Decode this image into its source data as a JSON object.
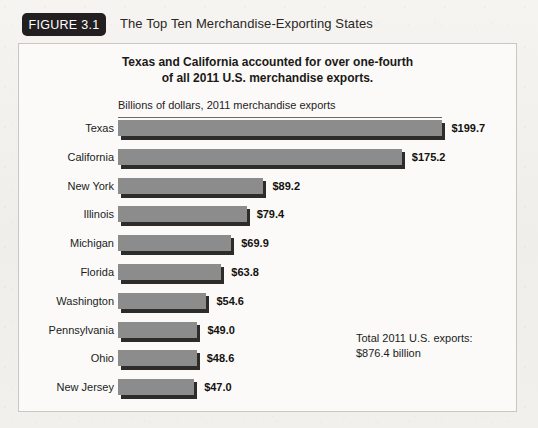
{
  "figure": {
    "badge_label": "FIGURE 3.1",
    "title": "The Top Ten Merchandise-Exporting States"
  },
  "chart_data": {
    "type": "bar",
    "orientation": "horizontal",
    "title": "Texas and California accounted for over one-fourth of all 2011 U.S. merchandise exports.",
    "title_line1": "Texas and California accounted for over one-fourth",
    "title_line2": "of all 2011 U.S. merchandise exports.",
    "subtitle": "Billions of dollars, 2011 merchandise exports",
    "xlabel": "Billions of dollars, 2011 merchandise exports",
    "ylabel": "",
    "xlim": [
      0,
      200
    ],
    "grid": false,
    "legend": false,
    "bar_color": "#8c8c8c",
    "categories": [
      "Texas",
      "California",
      "New York",
      "Illinois",
      "Michigan",
      "Florida",
      "Washington",
      "Pennsylvania",
      "Ohio",
      "New Jersey"
    ],
    "values": [
      199.7,
      175.2,
      89.2,
      79.4,
      69.9,
      63.8,
      54.6,
      49.0,
      48.6,
      47.0
    ],
    "value_labels": [
      "$199.7",
      "$175.2",
      "$89.2",
      "$79.4",
      "$69.9",
      "$63.8",
      "$54.6",
      "$49.0",
      "$48.6",
      "$47.0"
    ],
    "annotations": [
      "Total 2011 U.S. exports:",
      "$876.4 billion"
    ]
  },
  "note": {
    "line1": "Total 2011 U.S. exports:",
    "line2": "$876.4 billion"
  }
}
